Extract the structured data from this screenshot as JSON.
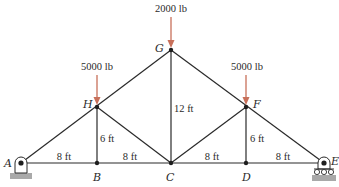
{
  "diagram": {
    "type": "truss",
    "colors": {
      "member": "#2a2a2a",
      "load_arrow": "#c8705a",
      "ground": "#a9a9a9"
    },
    "nodes": [
      {
        "id": "A",
        "label": "A",
        "x": 21,
        "y": 163
      },
      {
        "id": "B",
        "label": "B",
        "x": 97,
        "y": 163
      },
      {
        "id": "C",
        "label": "C",
        "x": 171,
        "y": 163
      },
      {
        "id": "D",
        "label": "D",
        "x": 246,
        "y": 163
      },
      {
        "id": "E",
        "label": "E",
        "x": 324,
        "y": 163
      },
      {
        "id": "H",
        "label": "H",
        "x": 97,
        "y": 107
      },
      {
        "id": "G",
        "label": "G",
        "x": 171,
        "y": 50
      },
      {
        "id": "F",
        "label": "F",
        "x": 246,
        "y": 107
      }
    ],
    "members": [
      [
        "A",
        "B"
      ],
      [
        "B",
        "C"
      ],
      [
        "C",
        "D"
      ],
      [
        "D",
        "E"
      ],
      [
        "A",
        "H"
      ],
      [
        "H",
        "G"
      ],
      [
        "G",
        "F"
      ],
      [
        "F",
        "E"
      ],
      [
        "H",
        "B"
      ],
      [
        "H",
        "C"
      ],
      [
        "G",
        "C"
      ],
      [
        "F",
        "C"
      ],
      [
        "F",
        "D"
      ]
    ],
    "dimensions": [
      {
        "label": "8 ft",
        "between": [
          "A",
          "B"
        ]
      },
      {
        "label": "8 ft",
        "between": [
          "B",
          "C"
        ]
      },
      {
        "label": "8 ft",
        "between": [
          "C",
          "D"
        ]
      },
      {
        "label": "8 ft",
        "between": [
          "D",
          "E"
        ]
      },
      {
        "label": "6 ft",
        "between": [
          "H",
          "B"
        ]
      },
      {
        "label": "12 ft",
        "between": [
          "G",
          "C"
        ]
      },
      {
        "label": "6 ft",
        "between": [
          "F",
          "D"
        ]
      }
    ],
    "loads": [
      {
        "node": "G",
        "label": "2000 lb",
        "direction": "down"
      },
      {
        "node": "H",
        "label": "5000 lb",
        "direction": "down"
      },
      {
        "node": "F",
        "label": "5000 lb",
        "direction": "down"
      }
    ],
    "supports": [
      {
        "node": "A",
        "type": "pin"
      },
      {
        "node": "E",
        "type": "roller"
      }
    ]
  }
}
